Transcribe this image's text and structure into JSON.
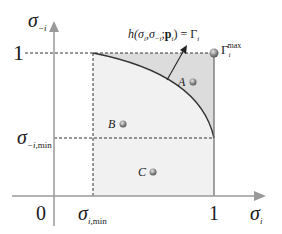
{
  "diagram": {
    "axes": {
      "y_label": {
        "symbol": "σ",
        "sub": "−i"
      },
      "x_label": {
        "symbol": "σ",
        "sub": "i"
      },
      "origin_label": "0",
      "y_tick_top": "1",
      "x_tick_right": "1",
      "y_tick_min": {
        "symbol": "σ",
        "sub": "−i,",
        "sub2": "min"
      },
      "x_tick_min": {
        "symbol": "σ",
        "sub": "i,",
        "sub2": "min"
      }
    },
    "curve_label": {
      "prefix": "h(",
      "args": "σ",
      "a1sub": "i",
      "comma": ",σ",
      "a2sub": "−i",
      "semi": ";",
      "p": "p",
      "psub": "i",
      "suffix": ") = Γ",
      "gsub": "i"
    },
    "gamma_max": {
      "symbol": "Γ",
      "sub": "i",
      "sup": "max"
    },
    "points": [
      {
        "label": "A"
      },
      {
        "label": "B"
      },
      {
        "label": "C"
      }
    ],
    "colors": {
      "axis": "#9a9a9a",
      "dashed": "#333333",
      "region_light": "#f1f1f1",
      "region_dark": "#dcdcdc",
      "point": "#8a8a8a"
    }
  }
}
